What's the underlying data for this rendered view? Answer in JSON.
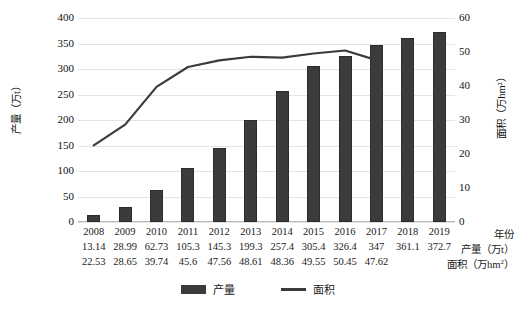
{
  "chart_data": {
    "type": "bar",
    "title": "",
    "categories": [
      "2008",
      "2009",
      "2010",
      "2011",
      "2012",
      "2013",
      "2014",
      "2015",
      "2016",
      "2017",
      "2018",
      "2019"
    ],
    "series": [
      {
        "name": "产量",
        "type": "bar",
        "axis": "left",
        "values": [
          13.14,
          28.99,
          62.73,
          105.3,
          145.3,
          199.3,
          257.4,
          305.4,
          326.4,
          347,
          361.1,
          372.7
        ]
      },
      {
        "name": "面积",
        "type": "line",
        "axis": "right",
        "values": [
          22.53,
          28.65,
          39.74,
          45.6,
          47.56,
          48.61,
          48.36,
          49.55,
          50.45,
          47.62,
          null,
          null
        ]
      }
    ],
    "xlabel": "年份",
    "ylabel": "产量（万t）",
    "y2label": "面积（万hm²）",
    "ylim": [
      0,
      400
    ],
    "y2lim": [
      0,
      60
    ],
    "yticks": [
      "0",
      "50",
      "100",
      "150",
      "200",
      "250",
      "300",
      "350",
      "400"
    ],
    "y2ticks": [
      "0",
      "10",
      "20",
      "30",
      "40",
      "50",
      "60"
    ],
    "grid": true,
    "legend_position": "bottom",
    "colors": {
      "bar": "#3b3b3b",
      "line": "#3b3b3b",
      "grid": "#e3e3e3",
      "background": "#ffffff"
    }
  },
  "axes": {
    "left_title": "产量（万t）",
    "right_title": "面积（万hm²）",
    "left_ticks": [
      "400",
      "350",
      "300",
      "250",
      "200",
      "150",
      "100",
      "50",
      "0"
    ],
    "right_ticks": [
      "60",
      "50",
      "40",
      "30",
      "20",
      "10",
      "0"
    ]
  },
  "table": {
    "rows": [
      {
        "label": "年份",
        "values": [
          "2008",
          "2009",
          "2010",
          "2011",
          "2012",
          "2013",
          "2014",
          "2015",
          "2016",
          "2017",
          "2018",
          "2019"
        ]
      },
      {
        "label": "产量（万t）",
        "values": [
          "13.14",
          "28.99",
          "62.73",
          "105.3",
          "145.3",
          "199.3",
          "257.4",
          "305.4",
          "326.4",
          "347",
          "361.1",
          "372.7"
        ]
      },
      {
        "label_prefix": "面积（万hm",
        "label_sup": "2",
        "label_suffix": "）",
        "label": "面积（万hm²）",
        "values": [
          "22.53",
          "28.65",
          "39.74",
          "45.6",
          "47.56",
          "48.61",
          "48.36",
          "49.55",
          "50.45",
          "47.62",
          "",
          ""
        ]
      }
    ]
  },
  "legend": {
    "items": [
      {
        "label": "产量",
        "marker": "bar-swatch",
        "color": "#3b3b3b"
      },
      {
        "label": "面积",
        "marker": "line-swatch",
        "color": "#3b3b3b"
      }
    ]
  }
}
